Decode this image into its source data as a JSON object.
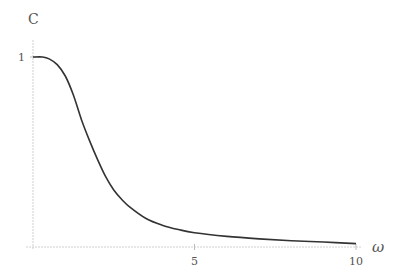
{
  "chart_data": {
    "type": "line",
    "title": "",
    "xlabel": "ω",
    "ylabel": "C",
    "xlim": [
      0,
      10
    ],
    "ylim": [
      0,
      1
    ],
    "x_ticks": [
      5,
      10
    ],
    "x_tick_labels": [
      "5",
      "10"
    ],
    "y_ticks": [
      1
    ],
    "y_tick_labels": [
      "1"
    ],
    "grid": false,
    "legend": null,
    "series": [
      {
        "name": "C(ω)",
        "color": "#333333",
        "x": [
          0,
          0.3,
          0.5,
          0.75,
          1.0,
          1.25,
          1.5,
          1.75,
          2.0,
          2.25,
          2.5,
          2.75,
          3.0,
          3.5,
          4.0,
          4.5,
          5.0,
          6.0,
          7.0,
          8.0,
          9.0,
          10.0
        ],
        "y": [
          1.0,
          1.0,
          0.99,
          0.96,
          0.9,
          0.8,
          0.67,
          0.56,
          0.46,
          0.37,
          0.3,
          0.25,
          0.21,
          0.15,
          0.115,
          0.092,
          0.075,
          0.056,
          0.043,
          0.033,
          0.026,
          0.018
        ]
      }
    ]
  }
}
